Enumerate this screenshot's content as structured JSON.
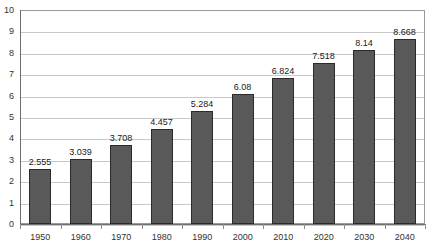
{
  "chart_data": {
    "type": "bar",
    "title": "",
    "subtitle": "",
    "xlabel": "",
    "ylabel": "",
    "categories": [
      "1950",
      "1960",
      "1970",
      "1980",
      "1990",
      "2000",
      "2010",
      "2020",
      "2030",
      "2040"
    ],
    "values": [
      2.555,
      3.039,
      3.708,
      4.457,
      5.284,
      6.08,
      6.824,
      7.518,
      8.14,
      8.668
    ],
    "data_labels": [
      "2.555",
      "3.039",
      "3.708",
      "4.457",
      "5.284",
      "6.08",
      "6.824",
      "7.518",
      "8.14",
      "8.668"
    ],
    "ylim": [
      0,
      10
    ],
    "ytick_labels": [
      "10",
      "9",
      "8",
      "7",
      "6",
      "5",
      "4",
      "3",
      "2",
      "1",
      "0"
    ],
    "ytick_values": [
      10,
      9,
      8,
      7,
      6,
      5,
      4,
      3,
      2,
      1,
      0
    ],
    "grid": "horizontal",
    "legend": "none",
    "series": [
      {
        "name": "",
        "values": [
          2.555,
          3.039,
          3.708,
          4.457,
          5.284,
          6.08,
          6.824,
          7.518,
          8.14,
          8.668
        ],
        "color": "#595959"
      }
    ],
    "colors": {
      "bar_fill": "#595959",
      "bar_outline": "#2b2b2b",
      "gridline": "#c9c9c9",
      "axis": "#6e6e6e",
      "plot_border": "#9a9a9a",
      "text": "#333333",
      "background": "#ffffff"
    }
  }
}
